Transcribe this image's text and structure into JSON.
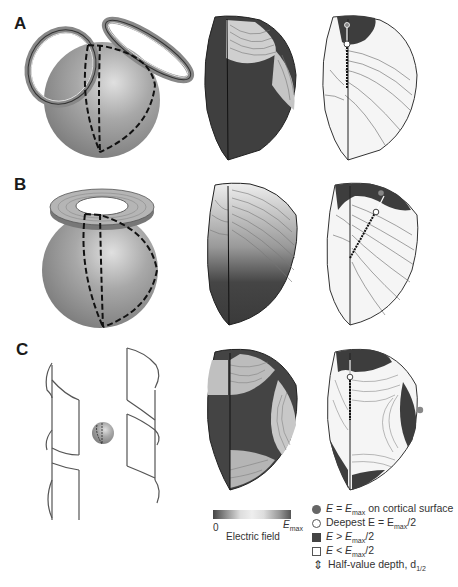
{
  "panels": [
    {
      "label": "A",
      "coil": "double-cone coil (two tilted circular windings)"
    },
    {
      "label": "B",
      "coil": "circular coil (flat annular winding)"
    },
    {
      "label": "C",
      "coil": "H-coil (deep TMS, saddle-shaped windings)"
    }
  ],
  "colorbar": {
    "min_label": "0",
    "max_label_main": "E",
    "max_label_sub": "max",
    "title": "Electric field",
    "colors": [
      "#444444",
      "#dddddd",
      "#eeeeee",
      "#555555"
    ]
  },
  "legend": [
    {
      "symbol": "filled-circle",
      "text_pre": "E = E",
      "sub": "max",
      "text_post": " on cortical surface"
    },
    {
      "symbol": "open-circle",
      "text_pre": "Deepest E = E",
      "sub": "max",
      "text_post": "/2"
    },
    {
      "symbol": "filled-square",
      "text_pre": "E > E",
      "sub": "max",
      "text_post": "/2"
    },
    {
      "symbol": "open-square",
      "text_pre": "E < E",
      "sub": "max",
      "text_post": "/2"
    },
    {
      "symbol": "double-arrow",
      "text_pre": "Half-value depth, d",
      "sub": "1/2",
      "text_post": ""
    }
  ],
  "colors": {
    "dark_field": "#3a3a3a",
    "light_field": "#f2f2f2",
    "sphere": "#9a9a9a",
    "contour": "#555555"
  }
}
